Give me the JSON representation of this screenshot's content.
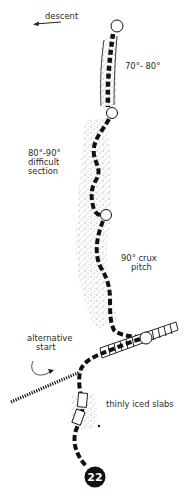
{
  "diagram": {
    "type": "climbing route topo",
    "route_number": "22",
    "colors": {
      "line": "#111111",
      "text": "#2a2a2a",
      "background": "#ffffff",
      "stipple": "#555555"
    },
    "labels": {
      "descent": "descent",
      "pitch1": "70°- 80°",
      "pitch2_line1": "80°-90°",
      "pitch2_line2": "difficult",
      "pitch2_line3": "section",
      "pitch3_line1": "90° crux",
      "pitch3_line2": "pitch",
      "alt_line1": "alternative",
      "alt_line2": "start",
      "slabs": "thinly iced slabs"
    },
    "belays": [
      {
        "name": "belay-1",
        "x": 117,
        "y": 26
      },
      {
        "name": "belay-2",
        "x": 112,
        "y": 113
      },
      {
        "name": "belay-3",
        "x": 106,
        "y": 215
      },
      {
        "name": "belay-4",
        "x": 146,
        "y": 338
      }
    ],
    "icons": {
      "descent_arrow": "left-arrow",
      "start_marker": "numbered-black-circle"
    }
  }
}
